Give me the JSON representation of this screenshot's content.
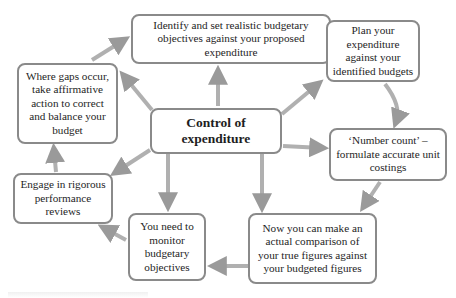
{
  "diagram": {
    "center": {
      "id": "control",
      "label": "Control of expenditure"
    },
    "nodes": [
      {
        "id": "identify",
        "label": "Identify and set realistic budgetary objectives against your proposed expenditure"
      },
      {
        "id": "plan",
        "label": "Plan your expenditure against your identified budgets"
      },
      {
        "id": "number_count",
        "label": "‘Number count’ – formulate accurate unit costings"
      },
      {
        "id": "comparison",
        "label": "Now you can make an actual comparison of your true figures against your budgeted figures"
      },
      {
        "id": "monitor",
        "label": "You need to monitor budgetary objectives"
      },
      {
        "id": "reviews",
        "label": "Engage in rigorous performance reviews"
      },
      {
        "id": "gaps",
        "label": "Where gaps occur, take affirmative action to correct and balance your budget"
      }
    ],
    "edges": [
      {
        "from": "identify",
        "to": "plan"
      },
      {
        "from": "plan",
        "to": "number_count"
      },
      {
        "from": "number_count",
        "to": "comparison"
      },
      {
        "from": "comparison",
        "to": "monitor"
      },
      {
        "from": "monitor",
        "to": "reviews"
      },
      {
        "from": "reviews",
        "to": "gaps"
      },
      {
        "from": "gaps",
        "to": "identify"
      },
      {
        "from": "control",
        "to": "identify"
      },
      {
        "from": "control",
        "to": "plan"
      },
      {
        "from": "control",
        "to": "number_count"
      },
      {
        "from": "control",
        "to": "comparison"
      },
      {
        "from": "control",
        "to": "monitor"
      },
      {
        "from": "control",
        "to": "reviews"
      },
      {
        "from": "control",
        "to": "gaps"
      }
    ],
    "colors": {
      "box_border": "#8a8a8a",
      "arrow": "#a8a8a8",
      "text": "#1e1e1e"
    }
  }
}
